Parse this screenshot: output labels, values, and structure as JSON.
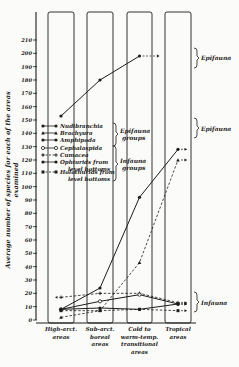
{
  "chart_data": {
    "type": "line",
    "title": "",
    "xlabel": "",
    "ylabel": "Average number of species for each of the areas examined",
    "ylim": [
      0,
      210
    ],
    "yticks": [
      0,
      10,
      20,
      30,
      40,
      50,
      60,
      70,
      80,
      90,
      100,
      110,
      120,
      130,
      140,
      150,
      160,
      170,
      180,
      190,
      200,
      210
    ],
    "categories": [
      "High-arct. areas",
      "Sub-arct. boreal areas",
      "Cold to warm-temp. transitional areas",
      "Tropical areas"
    ],
    "category_labels": [
      [
        "High-arct.",
        "areas"
      ],
      [
        "Sub-arct.",
        "boreal",
        "areas"
      ],
      [
        "Cold to",
        "warm-temp.",
        "transitional",
        "areas"
      ],
      [
        "Tropical",
        "areas"
      ]
    ],
    "legend": [
      {
        "name": "Nudibranchia",
        "marker": "filled-circle",
        "line": "solid",
        "group": "Epifauna groups"
      },
      {
        "name": "Brachyura",
        "marker": "filled-triangle",
        "line": "solid",
        "group": "Epifauna groups"
      },
      {
        "name": "Amphipoda",
        "marker": "filled-circle",
        "line": "solid",
        "group": "Epifauna groups"
      },
      {
        "name": "Cephalaspida",
        "marker": "open-circle",
        "line": "solid",
        "group": "Infauna groups"
      },
      {
        "name": "Cumacea",
        "marker": "cross",
        "line": "dashed",
        "group": "Infauna groups"
      },
      {
        "name": "Ophiurids from level bottoms",
        "marker": "filled-circle",
        "line": "solid",
        "group": "Infauna groups"
      },
      {
        "name": "Holothurids from level bottoms",
        "marker": "filled-square",
        "line": "dashed",
        "group": "Infauna groups"
      }
    ],
    "legend_groups": [
      "Epifauna groups",
      "Infauna groups"
    ],
    "series": [
      {
        "name": "Nudibranchia",
        "group": "Epifauna",
        "style": "solid",
        "marker": "filled-circle",
        "values": [
          153,
          180,
          198,
          null
        ],
        "continues_arrow": true
      },
      {
        "name": "Amphipoda",
        "group": "Epifauna",
        "style": "solid",
        "marker": "filled-circle",
        "values": [
          8,
          24,
          92,
          128
        ]
      },
      {
        "name": "Brachyura",
        "group": "Epifauna",
        "style": "dashed",
        "marker": "filled-triangle",
        "values": [
          2,
          7,
          43,
          120
        ]
      },
      {
        "name": "Cumacea",
        "group": "Infauna",
        "style": "dashed",
        "marker": "cross",
        "values": [
          17,
          20,
          20,
          13
        ]
      },
      {
        "name": "Cephalaspida",
        "group": "Infauna",
        "style": "solid",
        "marker": "open-circle",
        "values": [
          8,
          14,
          19,
          12
        ]
      },
      {
        "name": "Ophiurids from level bottoms",
        "group": "Infauna",
        "style": "solid",
        "marker": "filled-circle",
        "values": [
          8,
          9,
          8,
          12
        ]
      },
      {
        "name": "Holothurids from level bottoms",
        "group": "Infauna",
        "style": "dashed",
        "marker": "filled-square",
        "values": [
          7,
          7,
          8,
          7
        ]
      }
    ],
    "annotations": [
      "Epifauna",
      "Epifauna",
      "Infauna",
      "Epifauna groups",
      "Infauna groups"
    ],
    "grid": false,
    "legend_position": "upper-left"
  },
  "labels": {
    "epifauna_top": "Epifauna",
    "epifauna_mid": "Epifauna",
    "infauna_right": "Infauna",
    "epifauna_groups": [
      "Epifauna",
      "groups"
    ],
    "infauna_groups": [
      "Infauna",
      "groups"
    ]
  }
}
